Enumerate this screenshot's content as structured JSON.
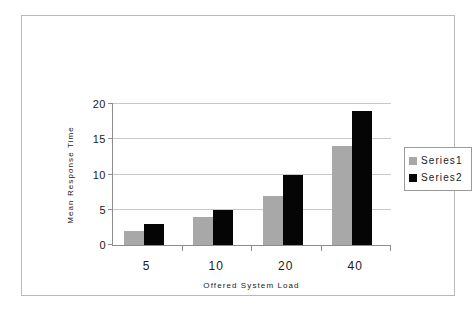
{
  "chart_data": {
    "type": "bar",
    "title": "",
    "xlabel": "Offered System Load",
    "ylabel": "Mean Response Time",
    "categories": [
      "5",
      "10",
      "20",
      "40"
    ],
    "series": [
      {
        "name": "Series1",
        "color": "#a8a8a8",
        "values": [
          2,
          4,
          7,
          14
        ]
      },
      {
        "name": "Series2",
        "color": "#050505",
        "values": [
          3,
          5,
          10,
          19
        ]
      }
    ],
    "ylim": [
      0,
      20
    ],
    "yticks": [
      0,
      5,
      10,
      15,
      20
    ],
    "ytick_labels": [
      "0",
      "5",
      "10",
      "15",
      "20"
    ],
    "grid": true,
    "grid_axis": "y",
    "legend": {
      "position": "right",
      "entries": [
        "Series1",
        "Series2"
      ]
    }
  },
  "figure": {
    "background": "#ffffff",
    "frame_color": "#b9b9b9",
    "axis_color": "#8c8c8c",
    "gridline_color": "#c8c8c8"
  }
}
